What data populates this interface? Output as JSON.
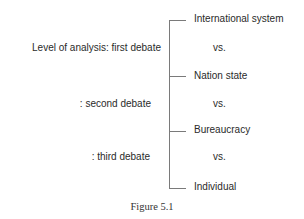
{
  "diagram": {
    "left_labels": [
      "Level of analysis: first debate",
      ": second debate",
      ": third debate"
    ],
    "right_items": [
      "International system",
      "vs.",
      "Nation state",
      "vs.",
      "Bureaucracy",
      "vs.",
      "Individual"
    ],
    "line_color": "#7a7a7a"
  },
  "caption": "Figure 5.1"
}
